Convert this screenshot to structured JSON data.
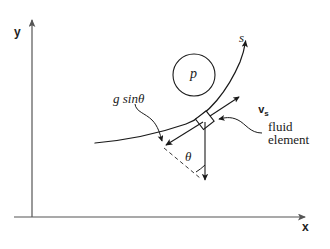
{
  "figure": {
    "type": "physics-diagram",
    "background_color": "#ffffff",
    "ink_color": "#1a1a1a",
    "axis_color": "#555555"
  },
  "axes": {
    "y_label": "y",
    "x_label": "x",
    "origin": {
      "x": 32,
      "y": 217
    },
    "y_axis_top": {
      "x": 32,
      "y": 15
    },
    "x_axis_right": {
      "x": 310,
      "y": 217
    }
  },
  "annotations": {
    "pressure_label": "p",
    "streamline_label": "s",
    "gravity_component_label": "g sinθ",
    "angle_label": "θ",
    "velocity_label": "v",
    "velocity_subscript": "s",
    "fluid_element_line1": "fluid",
    "fluid_element_line2": "element"
  },
  "elements": {
    "pressure_circle": {
      "cx": 194,
      "cy": 75,
      "r": 21
    },
    "fluid_element_box": {
      "cx": 205,
      "cy": 120,
      "size": 13,
      "rotation_deg": -38
    },
    "streamline": {
      "start": {
        "x": 95,
        "y": 143
      },
      "end": {
        "x": 246,
        "y": 40
      },
      "arrowhead_at": "end"
    },
    "gravity_vector": {
      "start": {
        "x": 205,
        "y": 120
      },
      "end": {
        "x": 205,
        "y": 183
      },
      "arrowhead_at": "end",
      "direction": "down"
    },
    "gravity_component_vector": {
      "start": {
        "x": 205,
        "y": 120
      },
      "end": {
        "x": 164,
        "y": 147
      },
      "arrowhead_at": "end",
      "direction": "down-left along streamline"
    },
    "velocity_vector": {
      "start": {
        "x": 205,
        "y": 120
      },
      "end": {
        "x": 240,
        "y": 96
      },
      "arrowhead_at": "end",
      "direction": "up-right tangent to streamline"
    },
    "dashed_line": {
      "start": {
        "x": 164,
        "y": 147
      },
      "end": {
        "x": 201,
        "y": 177
      },
      "style": "dashed"
    },
    "angle_arc": {
      "center": {
        "x": 205,
        "y": 120
      },
      "radius": 55,
      "between": "gravity vector and dashed line"
    }
  }
}
